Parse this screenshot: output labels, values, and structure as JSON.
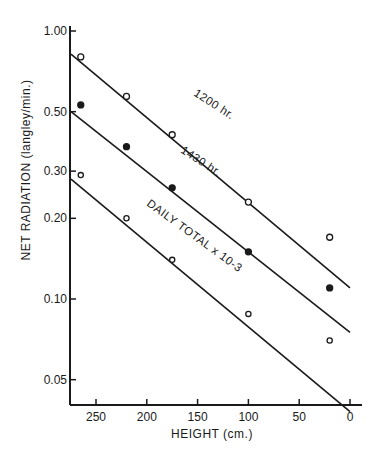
{
  "chart_data": {
    "type": "scatter",
    "title": "",
    "xlabel": "HEIGHT (cm.)",
    "ylabel": "NET RADIATION (langley/min.)",
    "xlim": [
      275,
      0
    ],
    "ylim": [
      0.035,
      1.0
    ],
    "yscale": "log",
    "xticks": [
      250,
      200,
      150,
      100,
      50,
      0
    ],
    "xtick_labels": [
      "250",
      "200",
      "150",
      "100",
      "50",
      "0"
    ],
    "yticks": [
      1.0,
      0.5,
      0.3,
      0.2,
      0.1,
      0.05
    ],
    "ytick_labels": [
      "1.00",
      "0.50",
      "0.30",
      "0.20",
      "0.10",
      "0.05"
    ],
    "grid": false,
    "series": [
      {
        "name": "1200 hr.",
        "marker": "open-circle",
        "x": [
          265,
          220,
          175,
          100,
          20
        ],
        "y": [
          0.8,
          0.57,
          0.41,
          0.23,
          0.17
        ],
        "fit_line": {
          "x": [
            275,
            0
          ],
          "y": [
            0.82,
            0.11
          ]
        }
      },
      {
        "name": "1430 hr.",
        "marker": "filled-circle",
        "x": [
          265,
          220,
          175,
          100,
          20
        ],
        "y": [
          0.53,
          0.37,
          0.26,
          0.15,
          0.11
        ],
        "fit_line": {
          "x": [
            275,
            0
          ],
          "y": [
            0.5,
            0.075
          ]
        }
      },
      {
        "name": "DAILY TOTAL x 10-3",
        "marker": "open-circle-small",
        "x": [
          265,
          220,
          175,
          100,
          20
        ],
        "y": [
          0.29,
          0.2,
          0.14,
          0.088,
          0.07
        ],
        "fit_line": {
          "x": [
            275,
            0
          ],
          "y": [
            0.28,
            0.038
          ]
        }
      }
    ],
    "annotations": [
      "1200 hr.",
      "1430 hr.",
      "DAILY TOTAL x 10-3"
    ]
  },
  "labels": {
    "xlabel": "HEIGHT (cm.)",
    "ylabel": "NET RADIATION (langley/min.)",
    "line_1200": "1200 hr.",
    "line_1430": "1430 hr.",
    "line_daily": "DAILY TOTAL x 10-3",
    "xtick": [
      "250",
      "200",
      "150",
      "100",
      "50",
      "0"
    ],
    "ytick": [
      "1.00",
      "0.50",
      "0.30",
      "0.20",
      "0.10",
      "0.05"
    ]
  }
}
